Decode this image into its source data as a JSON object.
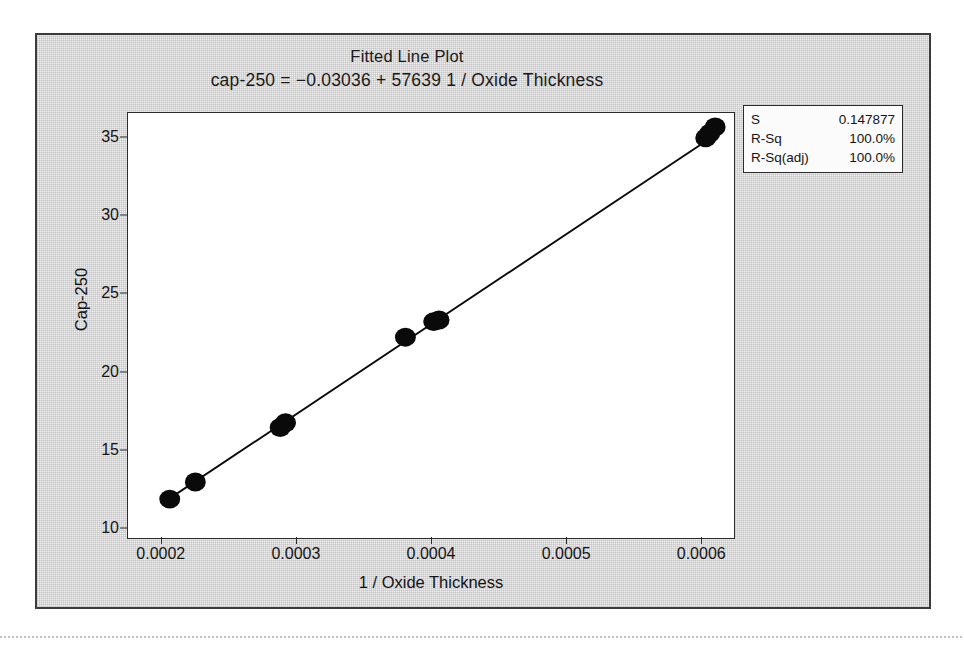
{
  "figure": {
    "title": "Fitted Line Plot",
    "subtitle": "cap-250 = −0.03036 + 57639 1 / Oxide Thickness"
  },
  "stats_box": {
    "rows": [
      {
        "label": "S",
        "value": "0.147877"
      },
      {
        "label": "R-Sq",
        "value": "100.0%"
      },
      {
        "label": "R-Sq(adj)",
        "value": "100.0%"
      }
    ]
  },
  "colors": {
    "frame": "#3b3b3b",
    "axis": "#2b2b2b",
    "marker": "#0a0a0a",
    "fit_line": "#0a0a0a",
    "panel_background": "#ffffff",
    "figure_background": "#efefef"
  },
  "chart_data": {
    "type": "scatter",
    "title": "Fitted Line Plot",
    "subtitle": "cap-250 = −0.03036 + 57639 1 / Oxide Thickness",
    "xlabel": "1 / Oxide Thickness",
    "ylabel": "Cap-250",
    "xlim": [
      0.000175,
      0.000625
    ],
    "ylim": [
      9.3,
      36.6
    ],
    "xticks": [
      0.0002,
      0.0003,
      0.0004,
      0.0005,
      0.0006
    ],
    "xticklabels": [
      "0.0002",
      "0.0003",
      "0.0004",
      "0.0005",
      "0.0006"
    ],
    "yticks": [
      10,
      15,
      20,
      25,
      30,
      35
    ],
    "yticklabels": [
      "10",
      "15",
      "20",
      "25",
      "30",
      "35"
    ],
    "grid": false,
    "legend": false,
    "series": [
      {
        "name": "Cap-250 observations",
        "marker": "filled-circle",
        "x": [
          0.000206,
          0.000225,
          0.000288,
          0.000292,
          0.000381,
          0.000402,
          0.000406,
          0.000604,
          0.000607,
          0.000611
        ],
        "y": [
          11.8,
          12.9,
          16.4,
          16.7,
          22.2,
          23.2,
          23.3,
          35.0,
          35.3,
          35.7
        ]
      }
    ],
    "fit": {
      "name": "Regression fit",
      "intercept": -0.03036,
      "slope": 57639,
      "equation": "cap-250 = −0.03036 + 57639 1 / Oxide Thickness",
      "x_range": [
        0.000206,
        0.000611
      ]
    },
    "annotations": {
      "S": "0.147877",
      "R-Sq": "100.0%",
      "R-Sq(adj)": "100.0%"
    }
  }
}
